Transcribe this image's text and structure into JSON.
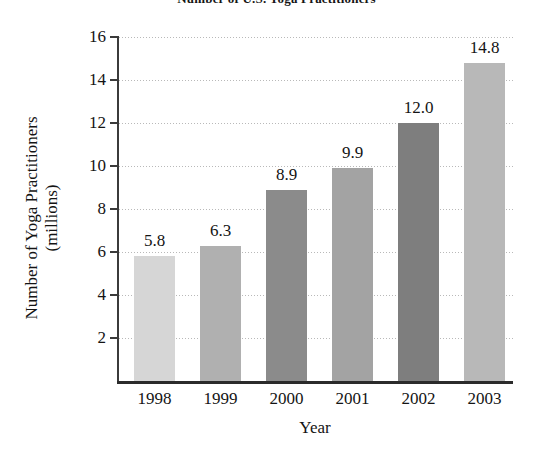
{
  "chart_data": {
    "type": "bar",
    "title": "Number of U.S. Yoga Practitioners",
    "xlabel": "Year",
    "ylabel_line1": "Number of Yoga Practitioners",
    "ylabel_line2": "(millions)",
    "categories": [
      "1998",
      "1999",
      "2000",
      "2001",
      "2002",
      "2003"
    ],
    "values": [
      5.8,
      6.3,
      8.9,
      9.9,
      12.0,
      14.8
    ],
    "value_labels": [
      "5.8",
      "6.3",
      "8.9",
      "9.9",
      "12.0",
      "14.8"
    ],
    "bar_colors": [
      "#d6d6d6",
      "#b0b0b0",
      "#8b8b8b",
      "#a3a3a3",
      "#7e7e7e",
      "#b8b8b8"
    ],
    "ylim": [
      0,
      16
    ],
    "ytick_labels": [
      "2",
      "4",
      "6",
      "8",
      "10",
      "12",
      "14",
      "16"
    ],
    "ytick_values": [
      2,
      4,
      6,
      8,
      10,
      12,
      14,
      16
    ],
    "grid": true,
    "legend": "none"
  }
}
